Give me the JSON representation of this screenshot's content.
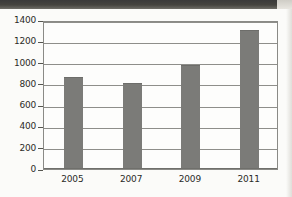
{
  "chart_data": {
    "type": "bar",
    "title": "",
    "xlabel": "",
    "ylabel": "",
    "categories": [
      "2005",
      "2007",
      "2009",
      "2011"
    ],
    "values": [
      860,
      805,
      980,
      1310
    ],
    "ylim": [
      0,
      1400
    ],
    "yticks": [
      0,
      200,
      400,
      600,
      800,
      1000,
      1200,
      1400
    ],
    "ytick_labels": [
      "0",
      "200",
      "400",
      "600",
      "800",
      "1000",
      "1200",
      "1400"
    ],
    "grid": true,
    "legend": false,
    "series": [
      {
        "name": "",
        "values": [
          860,
          805,
          980,
          1310
        ]
      }
    ],
    "colors": {
      "bar": "#7b7b78",
      "gridline": "#8e8e8a",
      "axis": "#55554f",
      "plot_background": "#fdfdfc",
      "page_background": "#fbfbf9",
      "text": "#2b2b28"
    }
  }
}
